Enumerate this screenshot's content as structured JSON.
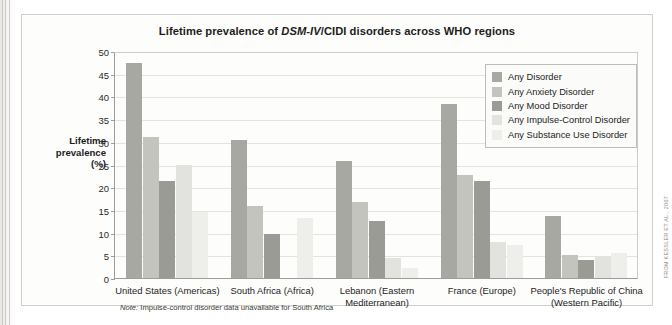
{
  "figure": {
    "title_prefix": "Lifetime prevalence of ",
    "title_italic": "DSM-IV",
    "title_suffix": "/CIDI disorders across WHO regions",
    "note_label": "Note:",
    "note_text": " Impulse-control disorder data unavailable for South Africa",
    "credit": "FROM KESSLER ET AL., 2007"
  },
  "chart_data": {
    "type": "bar",
    "title": "Lifetime prevalence of DSM-IV/CIDI disorders across WHO regions",
    "xlabel": "",
    "ylabel": "Lifetime prevalence (%)",
    "ylim": [
      0,
      50
    ],
    "yticks": [
      0,
      5,
      10,
      15,
      20,
      25,
      30,
      35,
      40,
      45,
      50
    ],
    "grid": true,
    "legend_position": "top-right",
    "categories": [
      "United States (Americas)",
      "South Africa (Africa)",
      "Lebanon (Eastern Mediterranean)",
      "France (Europe)",
      "People's Republic of China (Western Pacific)"
    ],
    "series": [
      {
        "name": "Any Disorder",
        "color": "#a8a8a3",
        "values": [
          47.4,
          30.3,
          25.8,
          38.4,
          13.6
        ]
      },
      {
        "name": "Any Anxiety Disorder",
        "color": "#c4c4bf",
        "values": [
          31.0,
          15.8,
          16.8,
          22.6,
          5.1
        ]
      },
      {
        "name": "Any Mood Disorder",
        "color": "#9b9b96",
        "values": [
          21.4,
          9.8,
          12.6,
          21.3,
          4.0
        ]
      },
      {
        "name": "Any Impulse-Control Disorder",
        "color": "#e2e2de",
        "values": [
          25.0,
          null,
          4.4,
          7.9,
          4.7
        ]
      },
      {
        "name": "Any Substance Use Disorder",
        "color": "#eeeeea",
        "values": [
          14.6,
          13.3,
          2.2,
          7.3,
          5.4
        ]
      }
    ]
  },
  "y_axis": {
    "label_line1": "Lifetime",
    "label_line2": "prevalence",
    "label_line3": "(%)"
  },
  "x_axis": {
    "labels": [
      {
        "line1": "United States (Americas)",
        "line2": ""
      },
      {
        "line1": "South Africa (Africa)",
        "line2": ""
      },
      {
        "line1": "Lebanon (Eastern",
        "line2": "Mediterranean)"
      },
      {
        "line1": "France (Europe)",
        "line2": ""
      },
      {
        "line1": "People's Republic of China",
        "line2": "(Western Pacific)"
      }
    ]
  }
}
